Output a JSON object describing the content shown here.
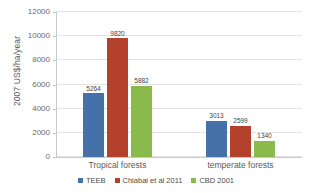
{
  "chart_data": {
    "type": "bar",
    "title": "",
    "subtitle": "",
    "xlabel": "",
    "ylabel": "2007 US$/ha/year",
    "ylim": [
      0,
      12000
    ],
    "ytick_values": [
      0,
      2000,
      4000,
      6000,
      8000,
      10000,
      12000
    ],
    "ytick_labels": [
      "0",
      "2000",
      "4000",
      "6000",
      "8000",
      "10000",
      "12000"
    ],
    "grid": true,
    "grid_axis": "y",
    "legend_position": "bottom-center",
    "categories": [
      "Tropical forests",
      "temperate forests"
    ],
    "series": [
      {
        "name": "TEEB",
        "color": "#4472a8",
        "values": [
          5264,
          3013
        ],
        "value_labels": [
          "5264",
          "3013"
        ]
      },
      {
        "name": "Chiabai et al 2011",
        "color": "#b3412c",
        "values": [
          9820,
          2599
        ],
        "value_labels": [
          "9820",
          "2599"
        ]
      },
      {
        "name": "CBD 2001",
        "color": "#8bba4c",
        "values": [
          5882,
          1340
        ],
        "value_labels": [
          "5882",
          "1340"
        ]
      }
    ]
  },
  "axes": {
    "y_title": "2007 US$/ha/year"
  },
  "legend": {
    "items": [
      {
        "label": "TEEB",
        "color": "#4472a8"
      },
      {
        "label": "Chiabai et al 2011",
        "color": "#b3412c"
      },
      {
        "label": "CBD 2001",
        "color": "#8bba4c"
      }
    ]
  },
  "colors": {
    "series_blue": "#4472a8",
    "series_red": "#b3412c",
    "series_green": "#8bba4c",
    "gridline": "#e4e4e4",
    "axis": "#c9c9c9",
    "text": "#5a5a5a",
    "background": "#ffffff"
  }
}
